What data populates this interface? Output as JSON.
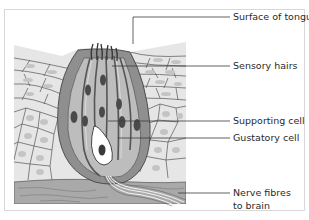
{
  "diagram": {
    "labels": [
      {
        "id": "surface",
        "text": "Surface of tongue"
      },
      {
        "id": "hairs",
        "text": "Sensory hairs"
      },
      {
        "id": "supporting",
        "text": "Supporting cell"
      },
      {
        "id": "gustatory",
        "text": "Gustatory cell"
      },
      {
        "id": "nerve",
        "line1": "Nerve fibres",
        "line2": "to brain"
      }
    ],
    "colors": {
      "epithelium_fill": "#e6e6e6",
      "nucleus_light": "#c4c4c4",
      "bud_outer": "#8f8f8f",
      "bud_inner": "#bdbdbd",
      "nucleus_dark": "#4a4a4a",
      "connective": "#a9a9a9",
      "outline": "#4f4f4f",
      "leader": "#3a3a3a"
    }
  }
}
